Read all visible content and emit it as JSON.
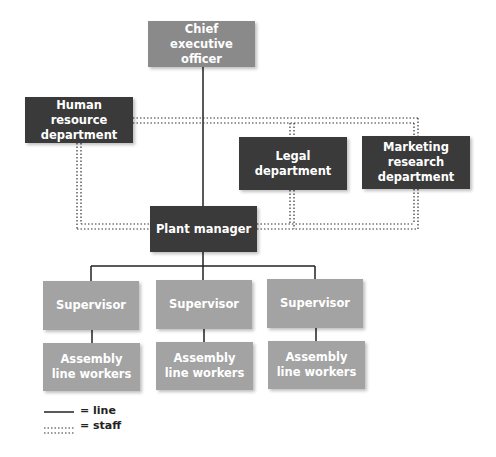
{
  "nodes": {
    "ceo": "Chief executive officer",
    "hr": "Human resource department",
    "legal": "Legal department",
    "marketing": "Marketing research department",
    "plant_manager": "Plant manager",
    "supervisors": [
      "Supervisor",
      "Supervisor",
      "Supervisor"
    ],
    "workers": [
      "Assembly line workers",
      "Assembly line workers",
      "Assembly line workers"
    ]
  },
  "legend": {
    "line": "= line",
    "staff": "= staff"
  },
  "colors": {
    "dark": "#3a3a3a",
    "mid": "#8a8a8a",
    "light": "#a3a3a3"
  }
}
